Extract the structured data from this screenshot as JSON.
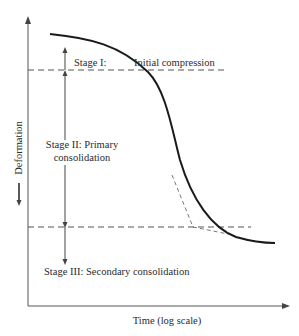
{
  "diagram": {
    "type": "consolidation-curve",
    "axes": {
      "x_label": "Time (log scale)",
      "y_label": "Deformation"
    },
    "stages": [
      {
        "id": "stage-1",
        "label": "Stage I:",
        "description": "Initial compression"
      },
      {
        "id": "stage-2",
        "label_line1": "Stage II: Primary",
        "label_line2": "consolidation"
      },
      {
        "id": "stage-3",
        "label": "Stage III: Secondary consolidation"
      }
    ],
    "colors": {
      "axis": "#555555",
      "curve": "#1a1a1a",
      "dashed": "#555555",
      "text": "#2b2b2b"
    }
  }
}
